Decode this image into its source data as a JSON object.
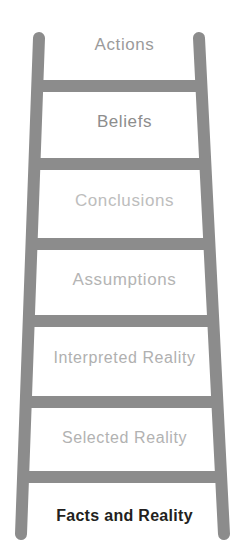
{
  "figure": {
    "name": "ladder-of-inference",
    "background_color": "#ffffff",
    "ladder_color": "#8c8c8c"
  },
  "ladder": {
    "rails": [
      {
        "name": "left-rail",
        "top_x": 39,
        "bottom_x": 21,
        "top_y": 38,
        "bottom_y": 534,
        "width": 12
      },
      {
        "name": "right-rail",
        "top_x": 199,
        "bottom_x": 224,
        "top_y": 38,
        "bottom_y": 534,
        "width": 12
      }
    ],
    "rungs": [
      {
        "name": "rung-1",
        "center_y": 86,
        "thickness": 12
      },
      {
        "name": "rung-2",
        "center_y": 164,
        "thickness": 12
      },
      {
        "name": "rung-3",
        "center_y": 244,
        "thickness": 12
      },
      {
        "name": "rung-4",
        "center_y": 321,
        "thickness": 12
      },
      {
        "name": "rung-5",
        "center_y": 402,
        "thickness": 12
      },
      {
        "name": "rung-6",
        "center_y": 477,
        "thickness": 12
      }
    ]
  },
  "steps": [
    {
      "label": "Actions",
      "color": "#9b9b9b"
    },
    {
      "label": "Beliefs",
      "color": "#8d8d8d"
    },
    {
      "label": "Conclusions",
      "color": "#bdbdbd"
    },
    {
      "label": "Assumptions",
      "color": "#b4b4b4"
    },
    {
      "label": "Interpreted Reality",
      "color": "#b0b0b0"
    },
    {
      "label": "Selected Reality",
      "color": "#b2b2b2"
    }
  ],
  "base": {
    "label": "Facts and Reality",
    "color": "#231f20"
  }
}
